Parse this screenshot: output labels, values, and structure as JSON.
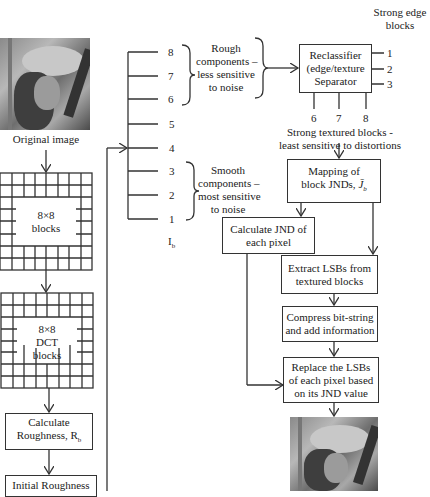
{
  "diagram": {
    "left_column": {
      "original_image_label": "Original image",
      "blocks_label": "8×8\nblocks",
      "blocks_label_line1": "8×8",
      "blocks_label_line2": "blocks",
      "dct_label_line1": "8×8",
      "dct_label_line2": "DCT",
      "dct_label_line3": "blocks",
      "roughness_line1": "Calculate",
      "roughness_line2": "Roughness, R",
      "roughness_sub": "b",
      "initial_roughness": "Initial Roughness"
    },
    "scale": {
      "levels": [
        "8",
        "7",
        "6",
        "5",
        "4",
        "3",
        "2",
        "1"
      ],
      "axis_label": "I",
      "axis_label_sub": "b"
    },
    "rough_components": {
      "line1": "Rough",
      "line2": "components –",
      "line3": "less sensitive",
      "line4": "to noise"
    },
    "smooth_components": {
      "line1": "Smooth",
      "line2": "components –",
      "line3": "most sensitive",
      "line4": "to noise"
    },
    "strong_edge": {
      "line1": "Strong edge",
      "line2": "blocks"
    },
    "reclassifier": {
      "line1": "Reclassifier",
      "line2": "(edge/texture",
      "line3": "Separator",
      "outputs_right": [
        "1",
        "2",
        "3"
      ],
      "outputs_bottom": [
        "6",
        "7",
        "8"
      ]
    },
    "strong_textured": {
      "line1": "Strong textured blocks -",
      "line2": "least sensitive to distortions"
    },
    "mapping": {
      "line1": "Mapping of",
      "line2": "block JNDs, ",
      "symbol": "J̄",
      "symbol_sub": "b"
    },
    "calc_jnd": {
      "line1": "Calculate JND of",
      "line2": "each pixel"
    },
    "extract": {
      "line1": "Extract LSBs from",
      "line2": "textured blocks"
    },
    "compress": {
      "line1": "Compress bit-string",
      "line2": "and add information"
    },
    "replace": {
      "line1": "Replace the LSBs",
      "line2": "of each pixel based",
      "line3": "on its JND value"
    },
    "colors": {
      "line": "#333333",
      "background": "#ffffff",
      "text": "#222222"
    }
  }
}
